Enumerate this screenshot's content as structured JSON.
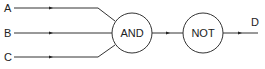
{
  "diagram": {
    "type": "logic-circuit",
    "inputs": [
      {
        "label": "A",
        "y": 8
      },
      {
        "label": "B",
        "y": 33
      },
      {
        "label": "C",
        "y": 57
      }
    ],
    "gates": [
      {
        "id": "and",
        "label": "AND",
        "cx": 132,
        "cy": 33,
        "r": 20
      },
      {
        "id": "not",
        "label": "NOT",
        "cx": 203,
        "cy": 33,
        "r": 20
      }
    ],
    "output": {
      "label": "D"
    },
    "edges": [
      {
        "from": "A",
        "to": "AND"
      },
      {
        "from": "B",
        "to": "AND"
      },
      {
        "from": "C",
        "to": "AND"
      },
      {
        "from": "AND",
        "to": "NOT"
      },
      {
        "from": "NOT",
        "to": "D"
      }
    ],
    "colors": {
      "stroke": "#333333",
      "text": "#222222",
      "background": "#ffffff"
    }
  }
}
